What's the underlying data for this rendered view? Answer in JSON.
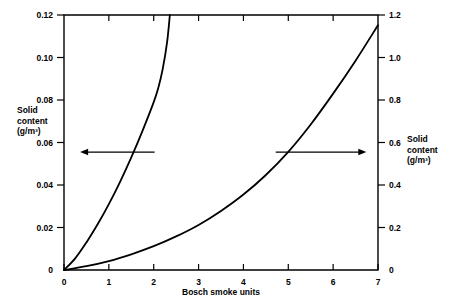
{
  "chart_data": {
    "type": "line",
    "title": "",
    "subtitle": "",
    "xlabel": "Bosch smoke units",
    "ylabel": "Solid content (g/m³)",
    "y2label": "Solid content (g/m³)",
    "xlim": [
      0,
      7
    ],
    "ylim": [
      0,
      0.12
    ],
    "y2lim": [
      0,
      1.2
    ],
    "grid": false,
    "legend_position": "none",
    "xticks": [
      0,
      1,
      2,
      3,
      4,
      5,
      6,
      7
    ],
    "xtick_labels": [
      "0",
      "1",
      "2",
      "3",
      "4",
      "5",
      "6",
      "7"
    ],
    "yticks": [
      0,
      0.02,
      0.04,
      0.06,
      0.08,
      0.1,
      0.12
    ],
    "ytick_labels": [
      "0",
      "0.02",
      "0.04",
      "0.06",
      "0.08",
      "0.10",
      "0.12"
    ],
    "y2ticks": [
      0,
      0.2,
      0.4,
      0.6,
      0.8,
      1.0,
      1.2
    ],
    "y2tick_labels": [
      "0",
      "0.2",
      "0.4",
      "0.6",
      "0.8",
      "1.0",
      "1.2"
    ],
    "annotations": [
      {
        "name": "left-axis-pointer",
        "text": "",
        "direction": "left",
        "x_start": 2.02,
        "x_end": 0.36,
        "y_axis": "left",
        "y_value": 0.0555
      },
      {
        "name": "right-axis-pointer",
        "text": "",
        "direction": "right",
        "x_start": 4.72,
        "x_end": 6.74,
        "y_axis": "right",
        "y_value": 0.555
      }
    ],
    "series": [
      {
        "name": "Left axis curve (solid content, g/m³)",
        "axis": "left",
        "points_x": [
          0.0,
          0.25,
          0.5,
          0.75,
          1.0,
          1.25,
          1.5,
          1.75,
          2.0,
          2.1,
          2.2,
          2.3,
          2.36
        ],
        "points_y": [
          0.0,
          0.0055,
          0.013,
          0.0215,
          0.031,
          0.0415,
          0.053,
          0.0655,
          0.079,
          0.0855,
          0.0945,
          0.1075,
          0.12
        ]
      },
      {
        "name": "Right axis curve (solid content, g/m³)",
        "axis": "right",
        "points_x": [
          0.0,
          0.5,
          1.0,
          1.5,
          2.0,
          2.5,
          3.0,
          3.5,
          4.0,
          4.5,
          5.0,
          5.5,
          6.0,
          6.5,
          7.0
        ],
        "points_y": [
          0.0,
          0.018,
          0.042,
          0.074,
          0.112,
          0.158,
          0.212,
          0.278,
          0.355,
          0.447,
          0.556,
          0.685,
          0.83,
          0.985,
          1.152
        ]
      }
    ]
  },
  "axis_titles": {
    "left_line1": "Solid",
    "left_line2": "content",
    "left_line3": "(g/m³)",
    "right_line1": "Solid",
    "right_line2": "content",
    "right_line3": "(g/m³)",
    "bottom": "Bosch smoke units"
  }
}
